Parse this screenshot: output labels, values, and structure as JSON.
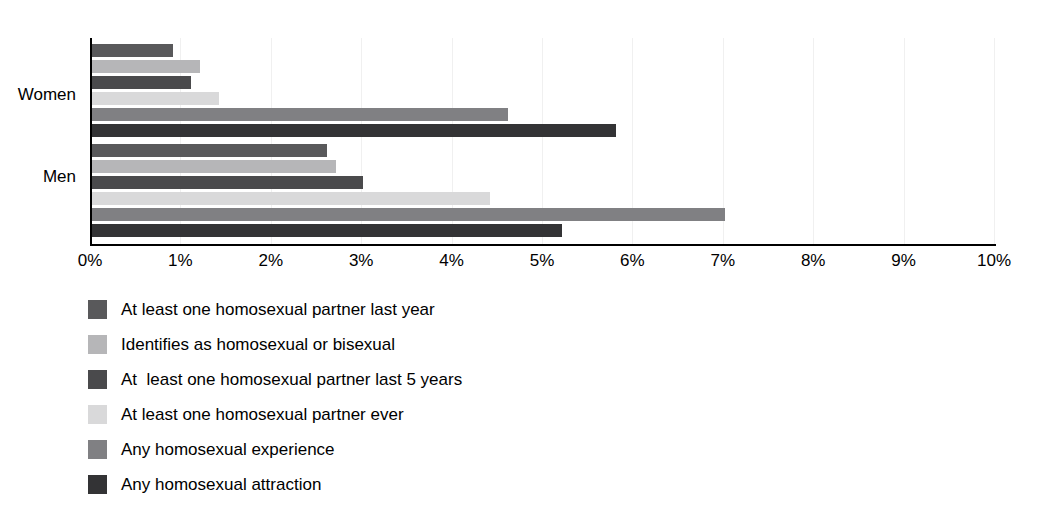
{
  "chart_data": {
    "type": "bar",
    "orientation": "horizontal",
    "title": "",
    "subtitle": "",
    "xlabel": "",
    "ylabel": "",
    "xlim": [
      0,
      10
    ],
    "xunit": "%",
    "grid": true,
    "legend_position": "bottom-left",
    "categories": [
      "Women",
      "Men"
    ],
    "xticks": [
      "0%",
      "1%",
      "2%",
      "3%",
      "4%",
      "5%",
      "6%",
      "7%",
      "8%",
      "9%",
      "10%"
    ],
    "xtick_values": [
      0,
      1,
      2,
      3,
      4,
      5,
      6,
      7,
      8,
      9,
      10
    ],
    "series": [
      {
        "name": "At least one homosexual partner last year",
        "color": "#59595b",
        "values": [
          0.9,
          2.6
        ]
      },
      {
        "name": "Identifies as homosexual or bisexual",
        "color": "#b6b6b8",
        "values": [
          1.2,
          2.7
        ]
      },
      {
        "name": "At  least one homosexual partner last 5 years",
        "color": "#4a4a4c",
        "values": [
          1.1,
          3.0
        ]
      },
      {
        "name": "At least one homosexual partner ever",
        "color": "#d9d9da",
        "values": [
          1.4,
          4.4
        ]
      },
      {
        "name": "Any homosexual experience",
        "color": "#808083",
        "values": [
          4.6,
          7.0
        ]
      },
      {
        "name": "Any homosexual attraction",
        "color": "#333335",
        "values": [
          5.8,
          5.2
        ]
      }
    ]
  },
  "legend": {
    "items": [
      {
        "label": "At least one homosexual partner last year",
        "color": "#59595b"
      },
      {
        "label": "Identifies as homosexual or bisexual",
        "color": "#b6b6b8"
      },
      {
        "label": "At  least one homosexual partner last 5 years",
        "color": "#4a4a4c"
      },
      {
        "label": "At least one homosexual partner ever",
        "color": "#d9d9da"
      },
      {
        "label": "Any homosexual experience",
        "color": "#808083"
      },
      {
        "label": "Any homosexual attraction",
        "color": "#333335"
      }
    ]
  },
  "axes": {
    "y_category_labels": [
      "Women",
      "Men"
    ],
    "axis_color": "#000000",
    "gridline_color": "#f0f0f0"
  }
}
